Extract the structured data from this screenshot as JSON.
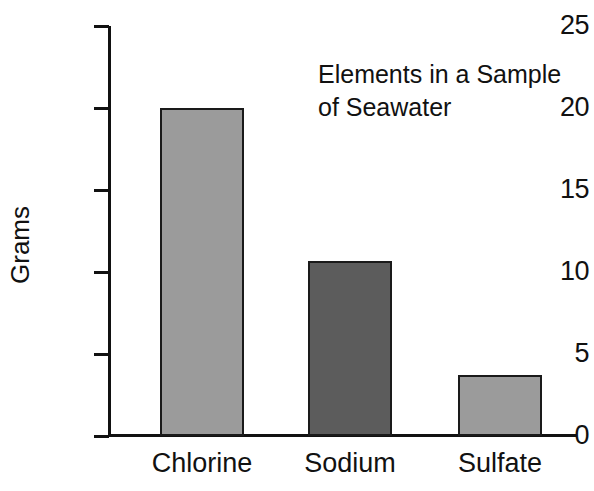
{
  "chart_data": {
    "type": "bar",
    "title": "Elements in a Sample of Seawater",
    "title_line1": "Elements in a Sample",
    "title_line2": "of Seawater",
    "xlabel": "",
    "ylabel": "Grams",
    "categories": [
      "Chlorine",
      "Sodium",
      "Sulfate"
    ],
    "values": [
      20.0,
      10.7,
      3.7
    ],
    "ylim": [
      0,
      25
    ],
    "yticks": [
      0,
      5,
      10,
      15,
      20,
      25
    ],
    "ytick_labels": [
      "0",
      "5",
      "10",
      "15",
      "20",
      "25"
    ],
    "grid": false,
    "legend": "none",
    "bar_colors": [
      "#9b9b9b",
      "#5c5c5c",
      "#9b9b9b"
    ],
    "bar_edge_color": "#1a1a1a",
    "axis_color": "#111111",
    "background": "#ffffff",
    "series": [
      {
        "name": "Grams",
        "points": [
          {
            "category": "Chlorine",
            "value": 20.0,
            "color": "#9b9b9b"
          },
          {
            "category": "Sodium",
            "value": 10.7,
            "color": "#5c5c5c"
          },
          {
            "category": "Sulfate",
            "value": 3.7,
            "color": "#9b9b9b"
          }
        ]
      }
    ]
  }
}
